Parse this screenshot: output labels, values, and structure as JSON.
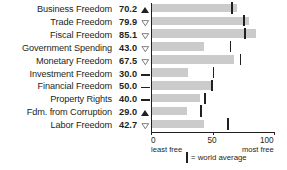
{
  "chart_data": {
    "type": "bar",
    "orientation": "horizontal",
    "title": "",
    "xlabel": "",
    "ylabel": "",
    "xlim": [
      0,
      100
    ],
    "grid": false,
    "axis_ticks": [
      0,
      50,
      100
    ],
    "axis_tick_labels": [
      "0",
      "50",
      "100"
    ],
    "axis_caption_left": "least free",
    "axis_caption_right": "most free",
    "legend": {
      "marker": "vertical-tick",
      "label": "= world average",
      "position": "bottom-center"
    },
    "categories": [
      "Business Freedom",
      "Trade Freedom",
      "Fiscal Freedom",
      "Government Spending",
      "Monetary Freedom",
      "Investment Freedom",
      "Financial Freedom",
      "Property Rights",
      "Fdm. from Corruption",
      "Labor Freedom"
    ],
    "values": [
      70.2,
      79.9,
      85.1,
      43.0,
      67.5,
      30.0,
      50.0,
      40.0,
      29.0,
      42.7
    ],
    "value_labels": [
      "70.2",
      "79.9",
      "85.1",
      "43.0",
      "67.5",
      "30.0",
      "50.0",
      "40.0",
      "29.0",
      "42.7"
    ],
    "trends": [
      "up",
      "down",
      "down",
      "down",
      "down",
      "flat",
      "flat",
      "flat",
      "up",
      "down"
    ],
    "series": [
      {
        "name": "World average",
        "values": [
          65,
          75,
          76,
          64,
          72,
          50,
          49,
          43,
          40,
          62
        ]
      }
    ],
    "colors": {
      "bar": "#cbcbcb",
      "ink": "#231f20",
      "background": "#ffffff"
    }
  },
  "rows": [
    {
      "label": "Business Freedom",
      "value": "70.2",
      "trend": "up"
    },
    {
      "label": "Trade Freedom",
      "value": "79.9",
      "trend": "down"
    },
    {
      "label": "Fiscal Freedom",
      "value": "85.1",
      "trend": "down"
    },
    {
      "label": "Government Spending",
      "value": "43.0",
      "trend": "down"
    },
    {
      "label": "Monetary Freedom",
      "value": "67.5",
      "trend": "down"
    },
    {
      "label": "Investment Freedom",
      "value": "30.0",
      "trend": "flat"
    },
    {
      "label": "Financial Freedom",
      "value": "50.0",
      "trend": "flat"
    },
    {
      "label": "Property Rights",
      "value": "40.0",
      "trend": "flat"
    },
    {
      "label": "Fdm. from Corruption",
      "value": "29.0",
      "trend": "up"
    },
    {
      "label": "Labor Freedom",
      "value": "42.7",
      "trend": "down"
    }
  ],
  "axis": {
    "tick0": "0",
    "tick50": "50",
    "tick100": "100",
    "caption_left": "least free",
    "caption_right": "most free"
  },
  "legend": {
    "text": "= world average"
  }
}
